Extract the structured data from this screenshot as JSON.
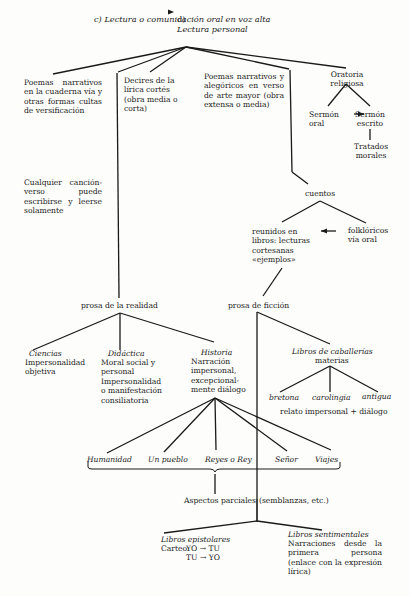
{
  "header": {
    "left": "c)  Lectura o comunicación oral en voz alta",
    "arrow": "→",
    "right_prefix": "d)",
    "right": "Lectura personal"
  },
  "branches": {
    "poemas_cuaderna": "Poemas narrativos en la cuaderna vía y otras formas cultas de versificación",
    "decires": "Decires de la lírica cortés (obra media o corta)",
    "poemas_arte_mayor": "Poemas narrativos y alegóricos en verso de arte mayor (obra extensa o media)",
    "oratoria": "Oratoria religiosa",
    "sermon_oral": "Sermón oral",
    "sermon_arrow": "→",
    "sermon_escrito": "Sermón escrito",
    "tratados": "Tratados morales",
    "cualquier": "Cualquier canción-verso puede escribirse y leerse solamente",
    "cuentos": "cuentos",
    "reunidos": "reunidos en libros: lecturas cortesanas «ejemplos»",
    "reunidos_arrow": "←",
    "folkloricos": "folklóricos vía oral"
  },
  "prosa_realidad": {
    "label": "prosa de la realidad",
    "ciencias_title": "Ciencias",
    "ciencias_desc": "Impersonalidad objetiva",
    "didactica_title": "Didáctica",
    "didactica_desc": "Moral social y personal Impersonalidad o manifestación consiliatoria",
    "historia_title": "Historia",
    "historia_desc": "Narración impersonal, excepcional-mente diálogo",
    "subjects": [
      "Humanidad",
      "Un pueblo",
      "Reyes o Rey",
      "Señor",
      "Viajes"
    ],
    "aspectos": "Aspectos parciales",
    "semblanzas": "(semblanzas, etc.)"
  },
  "prosa_ficcion": {
    "label": "prosa de ficción",
    "caballerias_title": "Libros de caballerías",
    "caballerias_sub": "materias",
    "materias": [
      "bretona",
      "carolingia",
      "antigua"
    ],
    "relato": "relato impersonal + diálogo",
    "epistolares_title": "Libros epistolares",
    "carteo_label": "Carteo:",
    "carteo_1": "YO → TU",
    "carteo_2": "TU → YO",
    "sentimentales_title": "Libros sentimentales",
    "sentimentales_desc": "Narraciones desde la primera persona (enlace con la expresión lírica)"
  }
}
